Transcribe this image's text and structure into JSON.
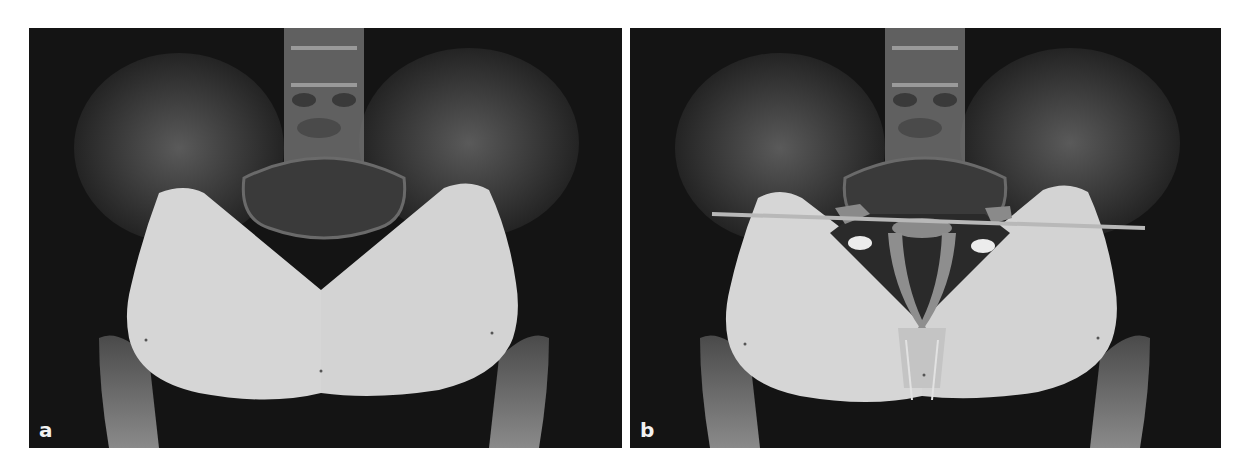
{
  "figure": {
    "panels": [
      {
        "id": "a",
        "label": "a",
        "description": "Pelvic AP radiograph with two overlapping triangular implant templates"
      },
      {
        "id": "b",
        "label": "b",
        "description": "Same radiograph with templates, horizontal reference line and overlaid pelvic outline"
      }
    ]
  },
  "colors": {
    "background": "#141414",
    "template_fill": "#d4d4d4",
    "bone_gray": "#6e6e6e",
    "reference_line": "#b8b8b8"
  }
}
